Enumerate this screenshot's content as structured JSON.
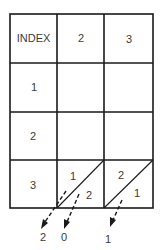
{
  "diagram": {
    "type": "lattice-multiplication-grid",
    "header_row": [
      "INDEX",
      "2",
      "3"
    ],
    "row_labels": [
      "1",
      "2",
      "3"
    ],
    "lattice_cells": [
      {
        "row": 3,
        "col": 2,
        "upper": "1",
        "lower": "2"
      },
      {
        "row": 3,
        "col": 3,
        "upper": "2",
        "lower": "1"
      }
    ],
    "result_digits": [
      "2",
      "0",
      "1"
    ],
    "colors": {
      "line": "#1a1a1a",
      "text": "#3a3a3a",
      "background": "#ffffff"
    }
  }
}
